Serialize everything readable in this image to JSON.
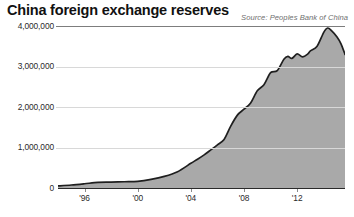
{
  "header": {
    "title": "China foreign exchange reserves",
    "source": "Source: Peoples Bank of China"
  },
  "colors": {
    "background": "#ffffff",
    "area_fill": "#a9a9a9",
    "line": "#1f1f1f",
    "gridline": "#d8d8d8",
    "axis": "#2a2a2a",
    "title_text": "#111111",
    "source_text": "#6f6f6f",
    "tick_text": "#2b2b2b"
  },
  "chart_data": {
    "type": "area",
    "title": "China foreign exchange reserves",
    "subtitle": "Source: Peoples Bank of China",
    "xlabel": "",
    "ylabel": "",
    "ylim": [
      0,
      4000000
    ],
    "xlim": [
      1994,
      2015.6
    ],
    "grid": true,
    "legend": false,
    "legend_position": "none",
    "ytick_labels": [
      "4,000,000",
      "3,000,000",
      "2,000,000",
      "1,000,000",
      "0"
    ],
    "ytick_values": [
      4000000,
      3000000,
      2000000,
      1000000,
      0
    ],
    "xtick_labels": [
      "'96",
      "'00",
      "'04",
      "'08",
      "'12"
    ],
    "xtick_values": [
      1996,
      2000,
      2004,
      2008,
      2012
    ],
    "series": [
      {
        "name": "Foreign exchange reserves",
        "x": [
          1994.0,
          1995.0,
          1996.0,
          1997.0,
          1998.0,
          1999.0,
          2000.0,
          2001.0,
          2002.0,
          2003.0,
          2004.0,
          2004.5,
          2005.0,
          2005.5,
          2006.0,
          2006.5,
          2007.0,
          2007.5,
          2008.0,
          2008.5,
          2009.0,
          2009.5,
          2010.0,
          2010.5,
          2011.0,
          2011.3,
          2011.6,
          2012.0,
          2012.4,
          2012.8,
          2013.0,
          2013.5,
          2014.0,
          2014.3,
          2014.6,
          2015.0,
          2015.3,
          2015.6
        ],
        "values": [
          51620,
          73600,
          105030,
          139890,
          144960,
          154680,
          165570,
          212170,
          286400,
          403250,
          609930,
          711000,
          818870,
          941000,
          1066340,
          1200000,
          1528250,
          1800000,
          1946000,
          2100000,
          2399000,
          2550000,
          2847000,
          2900000,
          3181000,
          3250000,
          3200000,
          3311000,
          3240000,
          3310000,
          3387000,
          3500000,
          3843000,
          3950000,
          3880000,
          3730000,
          3560000,
          3300000
        ]
      }
    ],
    "annotations": []
  }
}
